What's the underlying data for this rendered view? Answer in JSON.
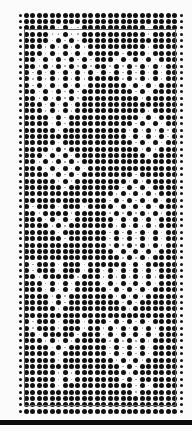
{
  "card": {
    "description": "punch-card knitting pattern chart",
    "columns": 26,
    "rows": 63,
    "origin_x": 20,
    "origin_y": 15,
    "spacing_x": 6.44,
    "spacing_y": 6.39,
    "dot_color": "#111111",
    "frame_color": "#666666",
    "bar_color": "#0c0c0c",
    "pattern_rows": [
      "XXXXXXXXXXXXXXXXXXXXXXXX",
      "XXXXXXXXXXXXXXXXXXXXXXXX",
      "XXXXX.X..XXXXXXXXXX.XXXX",
      "XXXX..X..XXXXXXXXXX.XXXX",
      "XXXX.X.X.XXXXXXXXXXXXXXX",
      "XXX.X.X.X.XXXXXXXXX.XXXX",
      "XXX.X.X.X.XXXXX.XXX.XXXX",
      "XX.X.X.X.X.XXX.X.X.X.XXX",
      "XX.X.X.X.X.XX.X.X.X.X.XX",
      "X.X.X.X.X.X.X.X.X.X.X.XX",
      "X.X.X.X.X.XXXXX.X.X.X.XX",
      "X.X.X.X.X.XXXXXX.X.X.XXX",
      "XX.X.X.X.XXXXXXXX.X.XXXX",
      "XX.X.X.X.XXXXXXXXX.XXXXX",
      "XXX.X.X.XXXXXXXXXXXXXXXX",
      "XXX.X.X.XXXXXXXXXXX.XXXX",
      "XXXX.X.XXXXXXXXXXX.X.XXX",
      "XXXX.X.XXXXXXXXXX.X.X.XX",
      "XXXXX.XXXXXXXXXX.X.X.X.X",
      "XXXXXXXXXXXXXXXX.X.X.X.X",
      "XXXXX.XXXXXXXXXXX.X.X.XX",
      "XXXX.X.XXXXXXXXXXX.X.XXX",
      "XXX.X.X.XXXXXXXXXXX.XXXX",
      "XX.X.X.X.XXXXXXXXXXXXXXX",
      "XXX.X.X.X.XXXXXXXXXXXXXX",
      "XXXX.X.X.XXXXXXXX.XXXXXX",
      "XXXXX.X.XXXXXXXX.X.XXXXX",
      "XXXXXX.XXXXXXXX.X.X.XXXX",
      "XXXXXXXXXXXXXX.X.X.X.XXX",
      "XXXXXXXXXXXXX.X.X.X.X.XX",
      "X.XXX.XXX.XXXX.X.X.X.XXX",
      "XX.XXXX.XXXXX.X.X.X.X.XX",
      "XXX.X.X.XXXXXX.X.X.X.XXX",
      "XXXX.X.XXXXXXX.X.X.X.XXX",
      "XXXXX.XXXXXXX.X.X.X.X.XX",
      "XXXXXX.XXXXXX.X.X.X.X.XX",
      "XXXXXXXXXXXXX.X.X.X.X.XX",
      "XXXXXXXXXXXXXX.X.X.X.XXX",
      "XXXXXXXXXXXXXXX.X.X.XXXX",
      "X.XXX.XXX.XXXXXX.X.XXXXX",
      "X.XXX.XXX.XX.X.X.X.X.XXX",
      "XX.XXXXX.XXX.X.X.X.X.XXX",
      "XXX.X.X.XXXX.X.X.X.X.XXX",
      "XXX.X.X.XXXXX.X.X.X.XXXX",
      "XXXX.X.XXXXXXX.X.X.XXXXX",
      "XXXX.X.XXXXXXXX.X.XXXXXX",
      "XXXXX.XXXXXXXXXX.XXXXXXX",
      "XXXXXXXXXXXXXXXXXXXXXXXX",
      "X.XXX.XXX.XXX.X.X.X.XXXX",
      "X.XXX.XXX.XX.X.X.X.X.XXX",
      "XX.XXXXX.XXX.X.X.X.X.XXX",
      "XXX.X.X.XXXXX.X.X.X.XXXX",
      "XXXX.X.XXXXXX.X.X.X.XXXX",
      "XXXXX.XXXXXXX.X.X.X.XXXX",
      "XXXXX.XXXXXXXX.X.X.XXXXX",
      "XXXXXXXXXXXXXXX.X.XXXXXX",
      "XXXXX.X.XXXXXXXX.XXXXXXX",
      "XXXXX.X.XXXXXXX.X.XXXXXX",
      "XXXXX.XXXXXXXXXXX.X.XXXX",
      "XXXXXXXXXXXXXXXXX.XXXXXX",
      "XXXXXXXXXXXXXXXXXXXXXXXX",
      "XXXXXXXXXXXXXXXXXXXXXXXX",
      "XXXXXXXXXXXXXXXXXXXXXXXX"
    ]
  }
}
